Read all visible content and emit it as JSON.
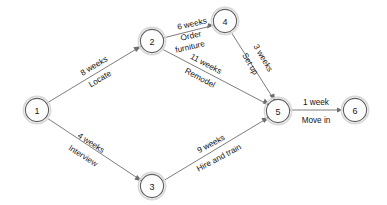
{
  "diagram": {
    "type": "activity-on-arrow network",
    "background_color": "#ffffff",
    "node_stroke_color": "#5f5f5f",
    "edge_color": "#6e6e6e",
    "text_color": "#141414",
    "nodes": [
      {
        "id": "1",
        "label": "1",
        "x": 37,
        "y": 110,
        "r": 12
      },
      {
        "id": "2",
        "label": "2",
        "x": 152,
        "y": 41,
        "r": 12
      },
      {
        "id": "3",
        "label": "3",
        "x": 152,
        "y": 186,
        "r": 12
      },
      {
        "id": "4",
        "label": "4",
        "x": 225,
        "y": 21,
        "r": 12
      },
      {
        "id": "5",
        "label": "5",
        "x": 278,
        "y": 111,
        "r": 12
      },
      {
        "id": "6",
        "label": "6",
        "x": 355,
        "y": 110,
        "r": 12
      }
    ],
    "edges": [
      {
        "id": "edge-1-2",
        "from": "1",
        "to": "2",
        "duration": "8 weeks",
        "activity": "Locate",
        "label_x": 94,
        "label_y": 70,
        "rotation": -31
      },
      {
        "id": "edge-1-3",
        "from": "1",
        "to": "3",
        "duration": "4 weeks",
        "activity": "Interview",
        "label_x": 92,
        "label_y": 150,
        "rotation": 33
      },
      {
        "id": "edge-2-4",
        "from": "2",
        "to": "4",
        "duration": "6 weeks",
        "activity": "Order furniture",
        "label_x": 190,
        "label_y": 30,
        "rotation": -13
      },
      {
        "id": "edge-2-5",
        "from": "2",
        "to": "5",
        "duration": "11 weeks",
        "activity": "Remodel",
        "label_x": 208,
        "label_y": 72,
        "rotation": 28
      },
      {
        "id": "edge-4-5",
        "from": "4",
        "to": "5",
        "duration": "3 weeks",
        "activity": "Set up",
        "label_x": 255,
        "label_y": 64,
        "rotation": 60
      },
      {
        "id": "edge-3-5",
        "from": "3",
        "to": "5",
        "duration": "9 weeks",
        "activity": "Hire and train",
        "label_x": 217,
        "label_y": 152,
        "rotation": -28
      },
      {
        "id": "edge-5-6",
        "from": "5",
        "to": "6",
        "duration": "1 week",
        "activity": "Move in",
        "label_x": 316,
        "label_y": 110,
        "rotation": 0
      }
    ]
  }
}
